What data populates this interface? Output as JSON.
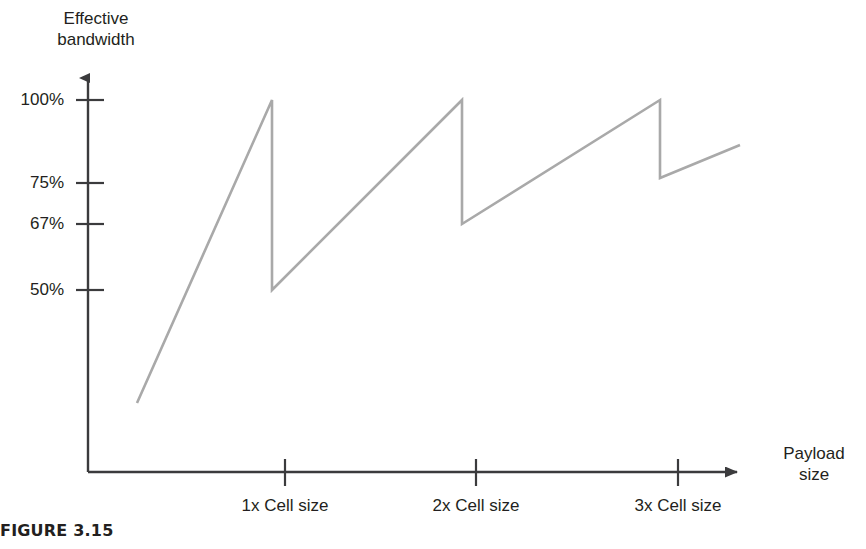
{
  "figure": {
    "caption": "FIGURE 3.15"
  },
  "axes": {
    "y_title": "Effective\nbandwidth",
    "x_title": "Payload\nsize",
    "y_ticks": [
      {
        "label": "100%",
        "value": 100,
        "y": 100
      },
      {
        "label": "75%",
        "value": 75,
        "y": 183
      },
      {
        "label": "67%",
        "value": 67,
        "y": 224
      },
      {
        "label": "50%",
        "value": 50,
        "y": 290
      }
    ],
    "x_ticks": [
      {
        "label": "1x Cell size",
        "value": 1,
        "x": 285
      },
      {
        "label": "2x Cell size",
        "value": 2,
        "x": 476
      },
      {
        "label": "3x Cell size",
        "value": 3,
        "x": 678
      }
    ]
  },
  "colors": {
    "axis": "#3b3b3d",
    "curve": "#a9a9a9",
    "text": "#231f20",
    "background": "#ffffff"
  },
  "chart_data": {
    "type": "line",
    "title": "FIGURE 3.15",
    "xlabel": "Payload size",
    "ylabel": "Effective bandwidth",
    "series": [
      {
        "name": "Effective bandwidth vs payload size",
        "comment": "Sawtooth: bandwidth climbs toward 100% as payload fills a cell, then drops abruptly when a new padded cell is needed.",
        "points": [
          {
            "x": 0.26,
            "y": 35
          },
          {
            "x": 1.0,
            "y": 100
          },
          {
            "x": 1.0,
            "y": 50
          },
          {
            "x": 2.0,
            "y": 100
          },
          {
            "x": 2.0,
            "y": 67
          },
          {
            "x": 3.0,
            "y": 100
          },
          {
            "x": 3.0,
            "y": 75
          },
          {
            "x": 3.42,
            "y": 88
          }
        ]
      }
    ],
    "xlim": [
      0,
      3.7
    ],
    "ylim": [
      0,
      108
    ],
    "grid": false,
    "legend": false,
    "xticks": [
      "1x Cell size",
      "2x Cell size",
      "3x Cell size"
    ],
    "yticks": [
      "100%",
      "75%",
      "67%",
      "50%"
    ]
  },
  "geometry": {
    "polyline": "137,403 272,100 272,290 462,100 462,224 660,100 660,178 740,145",
    "y_axis": {
      "x": 88,
      "top": 70,
      "bottom": 472
    },
    "x_axis": {
      "y": 472,
      "left": 88,
      "right": 745
    }
  }
}
